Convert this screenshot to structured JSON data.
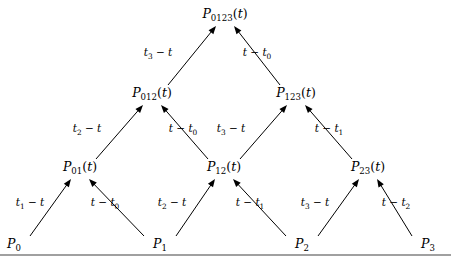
{
  "figure": {
    "type": "neville-aitken-pyramid",
    "background_color": "#ffffff",
    "line_color": "#000000",
    "rule_color": "#808080"
  },
  "nodes": {
    "level0": [
      {
        "id": "P0",
        "base": "P",
        "sub": "0",
        "arg": "",
        "x": 14,
        "y": 248
      },
      {
        "id": "P1",
        "base": "P",
        "sub": "1",
        "arg": "",
        "x": 160,
        "y": 248
      },
      {
        "id": "P2",
        "base": "P",
        "sub": "2",
        "arg": "",
        "x": 302,
        "y": 248
      },
      {
        "id": "P3",
        "base": "P",
        "sub": "3",
        "arg": "",
        "x": 428,
        "y": 248
      }
    ],
    "level1": [
      {
        "id": "P01",
        "base": "P",
        "sub": "01",
        "arg": "(t)",
        "x": 80,
        "y": 171
      },
      {
        "id": "P12",
        "base": "P",
        "sub": "12",
        "arg": "(t)",
        "x": 224,
        "y": 171
      },
      {
        "id": "P23",
        "base": "P",
        "sub": "23",
        "arg": "(t)",
        "x": 368,
        "y": 171
      }
    ],
    "level2": [
      {
        "id": "P012",
        "base": "P",
        "sub": "012",
        "arg": "(t)",
        "x": 152,
        "y": 97
      },
      {
        "id": "P123",
        "base": "P",
        "sub": "123",
        "arg": "(t)",
        "x": 296,
        "y": 97
      }
    ],
    "level3": [
      {
        "id": "P0123",
        "base": "P",
        "sub": "0123",
        "arg": "(t)",
        "x": 225,
        "y": 18
      }
    ]
  },
  "edges": [
    {
      "id": "e-P0-P01",
      "from": "P0",
      "to": "P01",
      "label_base": "t",
      "label_sub": "1",
      "label_rest": " − t",
      "label_order": "sub-first",
      "label_x": 30,
      "label_y": 206
    },
    {
      "id": "e-P1-P01",
      "from": "P1",
      "to": "P01",
      "label_base": "t",
      "label_sub": "0",
      "label_rest": "t − ",
      "label_order": "sub-last",
      "label_x": 105,
      "label_y": 206
    },
    {
      "id": "e-P1-P12",
      "from": "P1",
      "to": "P12",
      "label_base": "t",
      "label_sub": "2",
      "label_rest": " − t",
      "label_order": "sub-first",
      "label_x": 172,
      "label_y": 206
    },
    {
      "id": "e-P2-P12",
      "from": "P2",
      "to": "P12",
      "label_base": "t",
      "label_sub": "1",
      "label_rest": "t − ",
      "label_order": "sub-last",
      "label_x": 250,
      "label_y": 206
    },
    {
      "id": "e-P2-P23",
      "from": "P2",
      "to": "P23",
      "label_base": "t",
      "label_sub": "3",
      "label_rest": " − t",
      "label_order": "sub-first",
      "label_x": 315,
      "label_y": 206
    },
    {
      "id": "e-P3-P23",
      "from": "P3",
      "to": "P23",
      "label_base": "t",
      "label_sub": "2",
      "label_rest": "t − ",
      "label_order": "sub-last",
      "label_x": 396,
      "label_y": 206
    },
    {
      "id": "e-P01-P012",
      "from": "P01",
      "to": "P012",
      "label_base": "t",
      "label_sub": "2",
      "label_rest": " − t",
      "label_order": "sub-first",
      "label_x": 87,
      "label_y": 132
    },
    {
      "id": "e-P12-P012",
      "from": "P12",
      "to": "P012",
      "label_base": "t",
      "label_sub": "0",
      "label_rest": "t − ",
      "label_order": "sub-last",
      "label_x": 183,
      "label_y": 132
    },
    {
      "id": "e-P12-P123",
      "from": "P12",
      "to": "P123",
      "label_base": "t",
      "label_sub": "3",
      "label_rest": " − t",
      "label_order": "sub-first",
      "label_x": 231,
      "label_y": 132
    },
    {
      "id": "e-P23-P123",
      "from": "P23",
      "to": "P123",
      "label_base": "t",
      "label_sub": "1",
      "label_rest": "t − ",
      "label_order": "sub-last",
      "label_x": 329,
      "label_y": 132
    },
    {
      "id": "e-P012-P0123",
      "from": "P012",
      "to": "P0123",
      "label_base": "t",
      "label_sub": "3",
      "label_rest": " − t",
      "label_order": "sub-first",
      "label_x": 158,
      "label_y": 56
    },
    {
      "id": "e-P123-P0123",
      "from": "P123",
      "to": "P0123",
      "label_base": "t",
      "label_sub": "0",
      "label_rest": "t − ",
      "label_order": "sub-last",
      "label_x": 257,
      "label_y": 56
    }
  ],
  "baseline_rule": {
    "x1": 0,
    "y1": 255,
    "x2": 451,
    "y2": 255
  }
}
